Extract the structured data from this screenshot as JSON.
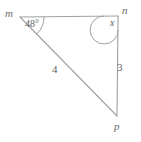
{
  "figure": {
    "type": "triangle-diagram",
    "stroke_color": "#a0a0a0",
    "text_color": "#5f5f5f",
    "background_color": "#ffffff",
    "vertices": [
      {
        "name": "m",
        "label": "m",
        "x": 20,
        "y": 17
      },
      {
        "name": "n",
        "label": "n",
        "x": 118,
        "y": 16
      },
      {
        "name": "p",
        "label": "p",
        "x": 117,
        "y": 116
      }
    ],
    "sides": [
      {
        "name": "mn",
        "from": "m",
        "to": "n",
        "label": ""
      },
      {
        "name": "mp",
        "from": "m",
        "to": "p",
        "label": "4"
      },
      {
        "name": "np",
        "from": "n",
        "to": "p",
        "label": "3"
      }
    ],
    "angles": [
      {
        "at": "m",
        "label": "48°",
        "value": 48,
        "unit": "degrees",
        "known": true
      },
      {
        "at": "n",
        "label": "x",
        "value": null,
        "unit": "degrees",
        "known": false
      }
    ]
  }
}
